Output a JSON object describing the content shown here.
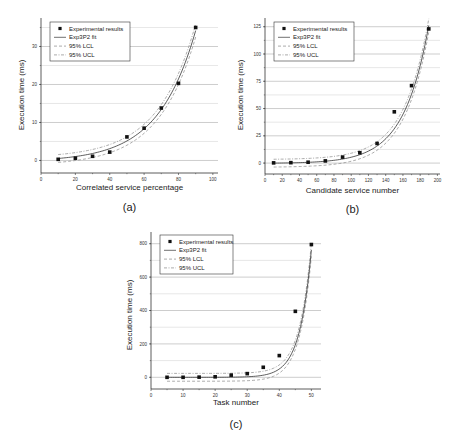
{
  "figure": {
    "legend_labels": [
      "Experimental results",
      "Exp3P2 fit",
      "95% LCL",
      "95% UCL"
    ],
    "ylabel": "Execution time (ms)"
  },
  "chart_data": [
    {
      "type": "scatter",
      "panel_label": "(a)",
      "title": "",
      "xlabel": "Correlated service percentage",
      "ylabel": "Execution time (ms)",
      "xlim": [
        0,
        100
      ],
      "ylim": [
        -2,
        37
      ],
      "xticks": [
        0,
        20,
        40,
        60,
        80,
        100
      ],
      "yticks": [
        0,
        10,
        20,
        30
      ],
      "grid": "horizontal",
      "legend_position": "upper left",
      "series": [
        {
          "name": "Experimental results",
          "kind": "points",
          "x": [
            10,
            20,
            30,
            40,
            50,
            60,
            70,
            80,
            90
          ],
          "y": [
            0.3,
            0.6,
            1.1,
            2.2,
            6.2,
            8.5,
            13.8,
            20.3,
            35.0
          ]
        },
        {
          "name": "Exp3P2 fit",
          "kind": "line",
          "style": "solid"
        },
        {
          "name": "95% LCL",
          "kind": "line",
          "style": "dashed"
        },
        {
          "name": "95% UCL",
          "kind": "line",
          "style": "dashdot"
        }
      ],
      "fit": {
        "a": 0.55,
        "b": 0.046,
        "c": -0.35
      }
    },
    {
      "type": "scatter",
      "panel_label": "(b)",
      "title": "",
      "xlabel": "Candidate service number",
      "ylabel": "Execution time (ms)",
      "xlim": [
        0,
        200
      ],
      "ylim": [
        -10,
        130
      ],
      "xticks": [
        0,
        20,
        40,
        60,
        80,
        100,
        120,
        140,
        160,
        180,
        200
      ],
      "yticks": [
        0,
        25,
        50,
        75,
        100,
        125
      ],
      "grid": "horizontal",
      "legend_position": "upper left",
      "series": [
        {
          "name": "Experimental results",
          "kind": "points",
          "x": [
            10,
            30,
            50,
            70,
            90,
            110,
            130,
            150,
            170,
            190
          ],
          "y": [
            0.2,
            0.4,
            0.8,
            2.0,
            5.5,
            9.5,
            18.0,
            47.0,
            71.0,
            123.0
          ]
        },
        {
          "name": "Exp3P2 fit",
          "kind": "line",
          "style": "solid"
        },
        {
          "name": "95% LCL",
          "kind": "line",
          "style": "dashed"
        },
        {
          "name": "95% UCL",
          "kind": "line",
          "style": "dashdot"
        }
      ],
      "fit": {
        "a": 0.18,
        "b": 0.0345,
        "c": -0.3
      }
    },
    {
      "type": "scatter",
      "panel_label": "(c)",
      "title": "",
      "xlabel": "Task number",
      "ylabel": "Execution time (ms)",
      "xlim": [
        0,
        53
      ],
      "ylim": [
        -60,
        860
      ],
      "xticks": [
        0,
        10,
        20,
        30,
        40,
        50
      ],
      "yticks": [
        0,
        200,
        400,
        600,
        800
      ],
      "grid": "horizontal",
      "legend_position": "upper left",
      "series": [
        {
          "name": "Experimental results",
          "kind": "points",
          "x": [
            5,
            10,
            15,
            20,
            25,
            30,
            35,
            40,
            45,
            50
          ],
          "y": [
            0,
            0,
            1,
            3,
            13,
            22,
            60,
            130,
            395,
            795
          ]
        },
        {
          "name": "Exp3P2 fit",
          "kind": "line",
          "style": "solid"
        },
        {
          "name": "95% LCL",
          "kind": "line",
          "style": "dashed"
        },
        {
          "name": "95% UCL",
          "kind": "line",
          "style": "dashdot"
        }
      ],
      "fit": {
        "a": 0.0009,
        "b": 0.273,
        "c": 0
      }
    }
  ]
}
